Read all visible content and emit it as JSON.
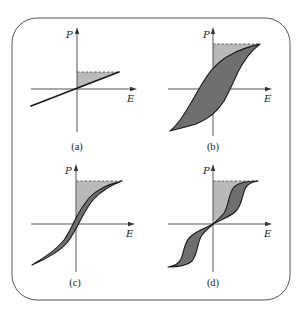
{
  "figure": {
    "axes": {
      "y_label": "P",
      "x_label": "E"
    },
    "panels": [
      {
        "id": "a",
        "label": "(a)",
        "curve": "linear"
      },
      {
        "id": "b",
        "label": "(b)",
        "curve": "wide hysteresis loop"
      },
      {
        "id": "c",
        "label": "(c)",
        "curve": "slim hysteresis loop"
      },
      {
        "id": "d",
        "label": "(d)",
        "curve": "double hysteresis loop"
      }
    ],
    "colors": {
      "frame": "#555555",
      "curve_stroke": "#1a1a1a",
      "loop_fill": "#6f6f6f",
      "energy_fill": "#b9b9b9",
      "dashed": "#555555"
    }
  }
}
